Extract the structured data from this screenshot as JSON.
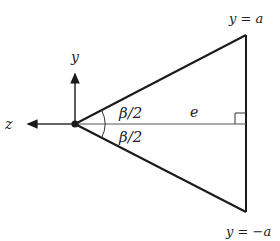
{
  "diagram": {
    "colors": {
      "stroke": "#1a1a1a",
      "axis": "#333333",
      "text": "#222222",
      "background": "#ffffff"
    },
    "labels": {
      "y_axis": "y",
      "z_axis": "z",
      "top_line": "y = a",
      "bottom_line": "y = −a",
      "upper_half_angle": "β/2",
      "lower_half_angle": "β/2",
      "edge": "e"
    },
    "geometry": {
      "origin": [
        75,
        124
      ],
      "top_apex": [
        246,
        35
      ],
      "bottom_apex": [
        246,
        212
      ],
      "y_axis_tip": [
        75,
        70
      ],
      "z_axis_tip": [
        24,
        124
      ],
      "right_angle_box_size": 11,
      "angle_arc_radius": 30
    }
  }
}
